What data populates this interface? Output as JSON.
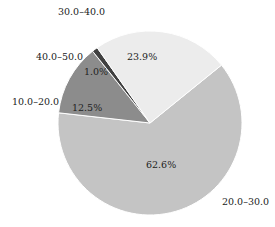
{
  "chart_data": {
    "type": "pie",
    "title": "",
    "categories": [
      "20.0–30.0",
      "10.0–20.0",
      "40.0–50.0",
      "30.0–40.0"
    ],
    "values": [
      62.6,
      12.5,
      1.0,
      23.9
    ],
    "value_labels": [
      "62.6%",
      "12.5%",
      "1.0%",
      "23.9%"
    ],
    "colors": [
      "#c4c4c4",
      "#8c8c8c",
      "#404040",
      "#ececec"
    ],
    "start_angle_deg_clockwise_from_top": 51,
    "legend": "none (labels outside slices)"
  },
  "labels": {
    "cat_20_30": "20.0–30.0",
    "cat_10_20": "10.0–20.0",
    "cat_40_50": "40.0–50.0",
    "cat_30_40": "30.0–40.0",
    "pct_20_30": "62.6%",
    "pct_10_20": "12.5%",
    "pct_40_50": "1.0%",
    "pct_30_40": "23.9%"
  }
}
